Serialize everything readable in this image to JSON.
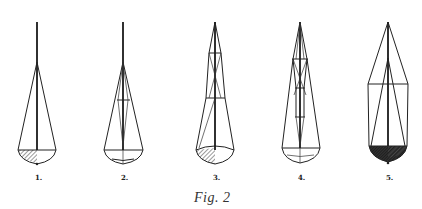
{
  "figure": {
    "caption": "Fig. 2",
    "ink_color": "#222222",
    "background": "#ffffff",
    "rigs": [
      {
        "id": 1,
        "label": "1.",
        "x": 37,
        "hull_fill": "light-hatched"
      },
      {
        "id": 2,
        "label": "2.",
        "x": 123,
        "hull_fill": "none"
      },
      {
        "id": 3,
        "label": "3.",
        "x": 215,
        "hull_fill": "light-hatched"
      },
      {
        "id": 4,
        "label": "4.",
        "x": 300,
        "hull_fill": "none"
      },
      {
        "id": 5,
        "label": "5.",
        "x": 388,
        "hull_fill": "dark-hatched"
      }
    ]
  }
}
